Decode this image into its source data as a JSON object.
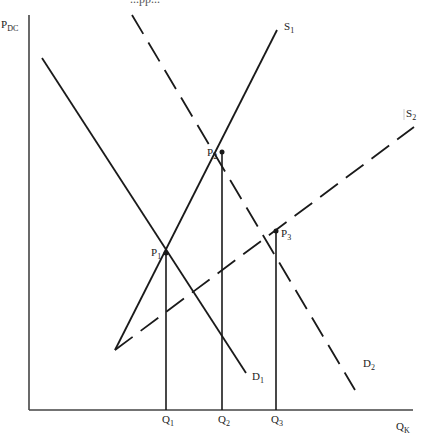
{
  "diagram": {
    "title_partial": "...pp...",
    "axes": {
      "y_label": {
        "main": "P",
        "sub": "DC"
      },
      "x_label": {
        "main": "Q",
        "sub": "K"
      }
    },
    "curves": [
      {
        "id": "S1",
        "label": {
          "main": "S",
          "sub": "1"
        },
        "style": "solid"
      },
      {
        "id": "S2",
        "label": {
          "main": "S",
          "sub": "2"
        },
        "style": "dashed"
      },
      {
        "id": "D1",
        "label": {
          "main": "D",
          "sub": "1"
        },
        "style": "solid"
      },
      {
        "id": "D2",
        "label": {
          "main": "D",
          "sub": "2"
        },
        "style": "dashed"
      }
    ],
    "points": [
      {
        "id": "P1",
        "label": {
          "main": "P",
          "sub": "1"
        }
      },
      {
        "id": "P2",
        "label": {
          "main": "P",
          "sub": "2"
        }
      },
      {
        "id": "P3",
        "label": {
          "main": "P",
          "sub": "3"
        }
      }
    ],
    "quantities": [
      {
        "id": "Q1",
        "label": {
          "main": "Q",
          "sub": "1"
        }
      },
      {
        "id": "Q2",
        "label": {
          "main": "Q",
          "sub": "2"
        }
      },
      {
        "id": "Q3",
        "label": {
          "main": "Q",
          "sub": "3"
        }
      }
    ],
    "colors": {
      "line": "#1a1a1a",
      "axis": "#444444",
      "background": "#ffffff"
    }
  }
}
